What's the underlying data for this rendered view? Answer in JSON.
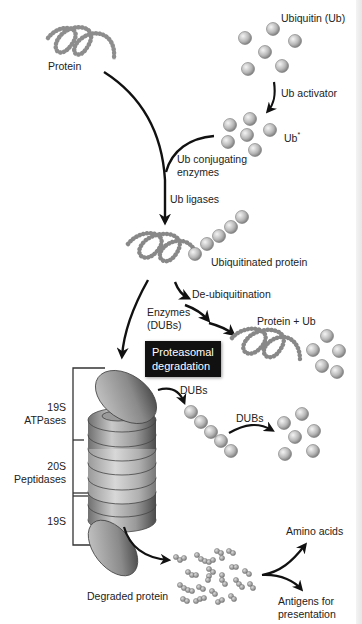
{
  "diagram": {
    "labels": {
      "protein": "Protein",
      "ubiquitin": "Ubiquitin (Ub)",
      "ub_activator": "Ub activator",
      "ub_star": "Ub",
      "ub_star_sup": "*",
      "ub_conjugating_1": "Ub conjugating",
      "ub_conjugating_2": "enzymes",
      "ub_ligases": "Ub ligases",
      "ubiquitinated_protein": "Ubiquitinated protein",
      "de_ubiquitination": "De-ubiquitination",
      "enzymes_1": "Enzymes",
      "enzymes_2": "(DUBs)",
      "protein_plus_ub": "Protein + Ub",
      "proteasomal_1": "Proteasomal",
      "proteasomal_2": "degradation",
      "dubs_1": "DUBs",
      "dubs_2": "DUBs",
      "s19_top_1": "19S",
      "s19_top_2": "ATPases",
      "s20_1": "20S",
      "s20_2": "Peptidases",
      "s19_bottom": "19S",
      "degraded_protein": "Degraded protein",
      "amino_acids": "Amino acids",
      "antigens_1": "Antigens for",
      "antigens_2": "presentation"
    },
    "colors": {
      "background": "#ffffff",
      "arrow": "#111111",
      "ball_light": "#e8e8e8",
      "ball_dark": "#8a8a8a",
      "label_box": "#111111"
    }
  }
}
